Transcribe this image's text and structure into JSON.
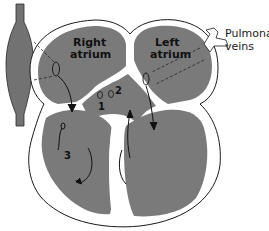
{
  "diagram": {
    "type": "heart-chamber-cross-section",
    "labels": {
      "right_atrium_line1": "Right",
      "right_atrium_line2": "atrium",
      "left_atrium_line1": "Left",
      "left_atrium_line2": "atrium",
      "pulmonary_line1": "Pulmonary",
      "pulmonary_line2": "veins"
    },
    "numbers": [
      "1",
      "2",
      "3"
    ],
    "colors": {
      "chamber_fill": "#7a7a7a",
      "vessel_fill": "#727272",
      "wall": "#ffffff",
      "outline": "#1a1a1a",
      "background": "#ffffff"
    }
  }
}
